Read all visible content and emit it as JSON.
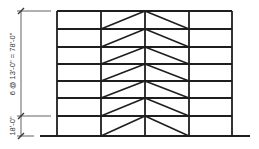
{
  "diagram": {
    "dimensions": {
      "upper": "6 @ 13'-0\" = 78'-0\"",
      "lower": "18'-0\""
    },
    "structure": {
      "stories": 7,
      "bays": 4,
      "bracing": "chevron (inverted-V) in two middle bays",
      "column_x": [
        57,
        101,
        145,
        189,
        232
      ],
      "floor_y": [
        11,
        29,
        47,
        64,
        81,
        98,
        116,
        136
      ],
      "ground_extent": [
        40,
        250
      ],
      "line_color": "#1e1e1e"
    }
  }
}
